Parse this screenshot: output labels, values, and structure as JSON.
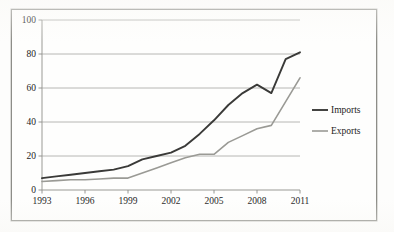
{
  "chart_data": {
    "type": "line",
    "title": "",
    "subtitle": "",
    "xlabel": "",
    "ylabel": "",
    "xlim": [
      1993,
      2011
    ],
    "ylim": [
      0,
      100
    ],
    "grid": true,
    "grid_axis": "y",
    "legend_position": "right",
    "x": [
      1993,
      1994,
      1995,
      1996,
      1997,
      1998,
      1999,
      2000,
      2001,
      2002,
      2003,
      2004,
      2005,
      2006,
      2007,
      2008,
      2009,
      2010,
      2011
    ],
    "xticks": [
      "1993",
      "1996",
      "1999",
      "2002",
      "2005",
      "2008",
      "2011"
    ],
    "xtick_values": [
      1993,
      1996,
      1999,
      2002,
      2005,
      2008,
      2011
    ],
    "yticks": [
      "0",
      "20",
      "40",
      "60",
      "80",
      "100"
    ],
    "ytick_values": [
      0,
      20,
      40,
      60,
      80,
      100
    ],
    "series": [
      {
        "name": "Imports",
        "color": "#3a3a38",
        "values": [
          7,
          8,
          9,
          10,
          11,
          12,
          14,
          18,
          20,
          22,
          26,
          33,
          41,
          50,
          57,
          62,
          57,
          77,
          81
        ]
      },
      {
        "name": "Exports",
        "color": "#9a9a95",
        "values": [
          5,
          5.5,
          6,
          6,
          6.5,
          7,
          7,
          10,
          13,
          16,
          19,
          21,
          21,
          28,
          32,
          36,
          38,
          52,
          66
        ]
      }
    ],
    "annotations": []
  },
  "legend": {
    "items": [
      {
        "label": "Imports",
        "color": "#3a3a38"
      },
      {
        "label": "Exports",
        "color": "#9a9a95"
      }
    ]
  },
  "axes": {
    "y_labels": [
      "100",
      "80",
      "60",
      "40",
      "20",
      "0"
    ],
    "x_labels": [
      "1993",
      "1996",
      "1999",
      "2002",
      "2005",
      "2008",
      "2011"
    ]
  },
  "colors": {
    "imports_line": "#3a3a38",
    "exports_line": "#9a9a95",
    "gridline": "#b0b0ab",
    "axis": "#8d8d88",
    "frame": "#8d8d88",
    "text": "#232323",
    "background": "#fefefd"
  }
}
